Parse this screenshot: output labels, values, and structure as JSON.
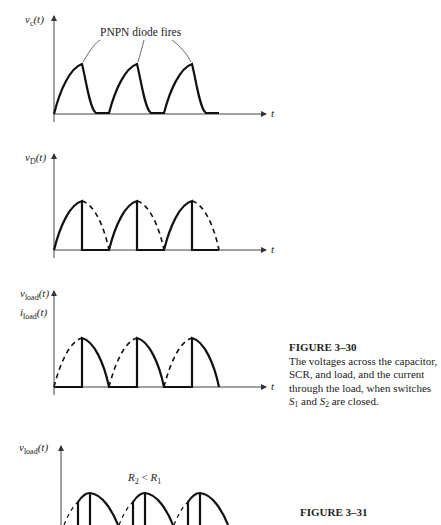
{
  "figure_30": {
    "title": "FIGURE 3–30",
    "caption_line1": "The voltages across the capacitor,",
    "caption_line2": "SCR, and load, and the current",
    "caption_line3": "through the load, when switches",
    "caption_s1": "S",
    "caption_s1_sub": "1",
    "caption_and": " and ",
    "caption_s2": "S",
    "caption_s2_sub": "2",
    "caption_end": " are closed."
  },
  "figure_31": {
    "title": "FIGURE 3–31"
  },
  "panels": [
    {
      "ylabel_main": "v",
      "ylabel_sub": "c",
      "ylabel_tail": "(t)",
      "xlabel": "t",
      "annotation": "PNPN diode fires"
    },
    {
      "ylabel_main": "v",
      "ylabel_sub": "D",
      "ylabel_tail": "(t)",
      "xlabel": "t"
    },
    {
      "ylabel_main": "v",
      "ylabel_sub": "load",
      "ylabel_tail": "(t)",
      "ylabel2_main": "i",
      "ylabel2_sub": "load",
      "ylabel2_tail": "(t)",
      "xlabel": "t"
    },
    {
      "ylabel_main": "v",
      "ylabel_sub": "load",
      "ylabel_tail": "(t)",
      "annotation_r2": "R",
      "annotation_r2_sub": "2",
      "annotation_lt": " < ",
      "annotation_r1": "R",
      "annotation_r1_sub": "1"
    }
  ]
}
